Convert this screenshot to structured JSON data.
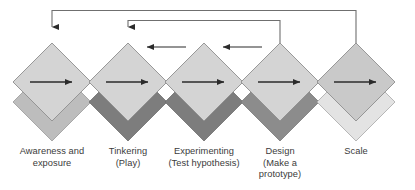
{
  "diagram": {
    "type": "process-flow",
    "canvas": {
      "width": 415,
      "height": 190,
      "background": "#ffffff"
    },
    "palette": {
      "front_diamond_fill": "#d4d4d4",
      "front_diamond_stroke": "#8f8f8f",
      "back_diamond_dark": "#7d7d7d",
      "back_diamond_mid": "#bdbdbd",
      "back_diamond_light": "#e3e3e3",
      "arrow_color": "#2f2f2f",
      "connector_color": "#6f6f6f",
      "label_color": "#3b3b3b"
    },
    "nodes": [
      {
        "id": "awareness",
        "index": 1,
        "label": "Awareness and\nexposure",
        "label_lines": [
          "Awareness and",
          "exposure"
        ],
        "center_x": 52,
        "center_y": 85,
        "front_fill": "#d4d4d4",
        "back_fill": "#bdbdbd",
        "inner_arrow": "right"
      },
      {
        "id": "tinkering",
        "index": 2,
        "label": "Tinkering\n(Play)",
        "label_lines": [
          "Tinkering",
          "(Play)"
        ],
        "center_x": 128,
        "center_y": 85,
        "front_fill": "#d4d4d4",
        "back_fill": "#7d7d7d",
        "inner_arrow": "right"
      },
      {
        "id": "experimenting",
        "index": 3,
        "label": "Experimenting\n(Test hypothesis)",
        "label_lines": [
          "Experimenting",
          "(Test hypothesis)"
        ],
        "center_x": 204,
        "center_y": 85,
        "front_fill": "#d4d4d4",
        "back_fill": "#7d7d7d",
        "inner_arrow": "right"
      },
      {
        "id": "design",
        "index": 4,
        "label": "Design\n(Make a\nprototype)",
        "label_lines": [
          "Design",
          "(Make a",
          "prototype)"
        ],
        "center_x": 280,
        "center_y": 85,
        "front_fill": "#d4d4d4",
        "back_fill": "#8c8c8c",
        "inner_arrow": "right"
      },
      {
        "id": "scale",
        "index": 5,
        "label": "Scale",
        "label_lines": [
          "Scale"
        ],
        "center_x": 356,
        "center_y": 85,
        "front_fill": "#c9c9c9",
        "back_fill": "#e3e3e3",
        "inner_arrow": "right"
      }
    ],
    "feedback_connectors": [
      {
        "id": "scale-to-awareness",
        "from": "scale",
        "to": "awareness",
        "direction": "right-to-left",
        "top_y": 10
      },
      {
        "id": "design-to-tinkering",
        "from": "design",
        "to": "tinkering",
        "direction": "right-to-left",
        "top_y": 20
      }
    ],
    "back_arrows": [
      {
        "id": "experimenting-to-tinkering",
        "from": "experimenting",
        "to": "tinkering",
        "direction": "left"
      },
      {
        "id": "design-to-experimenting",
        "from": "design",
        "to": "experimenting",
        "direction": "left"
      }
    ]
  }
}
